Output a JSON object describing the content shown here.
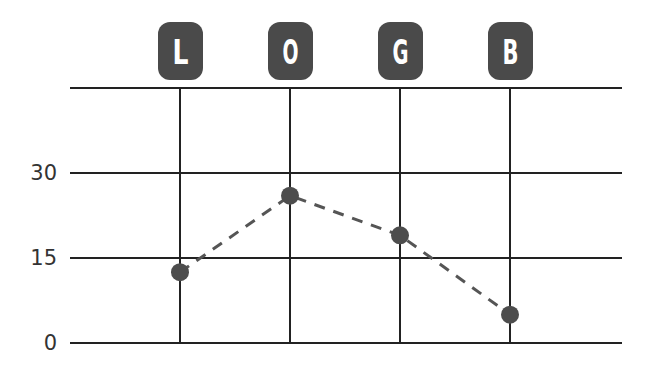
{
  "chart_data": {
    "type": "line",
    "title": "",
    "xlabel": "",
    "ylabel": "",
    "categories": [
      "L",
      "O",
      "G",
      "B"
    ],
    "series": [
      {
        "name": "value",
        "values": [
          12.5,
          26,
          19,
          5
        ]
      }
    ],
    "yticks": [
      "0",
      "15",
      "30"
    ],
    "ylim": [
      0,
      45
    ],
    "grid": true,
    "legend": null,
    "line_style": "dashed",
    "colors": {
      "badge": "#4a4a4a",
      "point": "#4d4d4d",
      "line": "#555555",
      "grid": "#222222"
    }
  }
}
